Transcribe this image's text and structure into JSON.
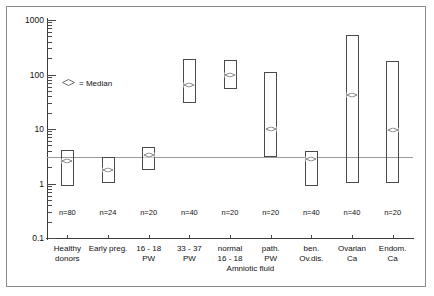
{
  "chart_data": {
    "type": "box",
    "title": "",
    "xlabel": "",
    "ylabel": "",
    "yscale": "log",
    "ylim": [
      0.1,
      1000
    ],
    "ytick_labels": [
      "1000",
      "100",
      "10",
      "1",
      "0.1"
    ],
    "ytick_values": [
      1000,
      100,
      10,
      1,
      0.1
    ],
    "grid": false,
    "reference_line": 3.0,
    "legend": {
      "marker": "diamond",
      "text": "= Median",
      "position": "inside-upper-left"
    },
    "group_label": "Amniotic fluid",
    "categories": [
      "Healthy donors",
      "Early preg.",
      "16 - 18 PW",
      "33 - 37 PW",
      "normal 16 - 18 PW",
      "path. PW",
      "ben. Ov.dis.",
      "Ovarian Ca",
      "Endom. Ca"
    ],
    "category_lines": [
      [
        "Healthy",
        "donors"
      ],
      [
        "Early preg.",
        ""
      ],
      [
        "16 - 18",
        "PW"
      ],
      [
        "33 - 37",
        "PW"
      ],
      [
        "normal",
        "16 - 18"
      ],
      [
        "path.",
        "PW"
      ],
      [
        "ben.",
        "Ov.dis."
      ],
      [
        "Ovarian",
        "Ca"
      ],
      [
        "Endom.",
        "Ca"
      ]
    ],
    "n_labels": [
      "n=80",
      "n=24",
      "n=20",
      "n=40",
      "n=20",
      "n=20",
      "n=40",
      "n=40",
      "n=20"
    ],
    "n_values": [
      80,
      24,
      20,
      40,
      20,
      20,
      40,
      40,
      20
    ],
    "boxes": [
      {
        "category": "Healthy donors",
        "min": 0.9,
        "max": 4.2,
        "median": 2.6
      },
      {
        "category": "Early preg.",
        "min": 1.0,
        "max": 3.0,
        "median": 1.8
      },
      {
        "category": "16 - 18 PW",
        "min": 1.8,
        "max": 4.7,
        "median": 3.3
      },
      {
        "category": "33 - 37 PW",
        "min": 30.0,
        "max": 190.0,
        "median": 65.0
      },
      {
        "category": "normal 16 - 18 PW",
        "min": 55.0,
        "max": 185.0,
        "median": 100.0
      },
      {
        "category": "path. PW",
        "min": 3.0,
        "max": 110.0,
        "median": 10.0
      },
      {
        "category": "ben. Ov.dis.",
        "min": 0.9,
        "max": 4.0,
        "median": 2.8
      },
      {
        "category": "Ovarian Ca",
        "min": 1.0,
        "max": 520.0,
        "median": 42.0
      },
      {
        "category": "Endom. Ca",
        "min": 1.0,
        "max": 175.0,
        "median": 9.5
      }
    ]
  }
}
